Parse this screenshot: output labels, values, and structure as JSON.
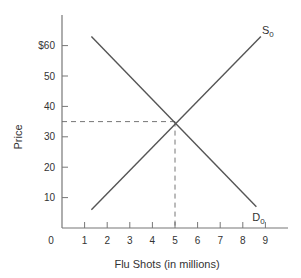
{
  "chart_data": {
    "type": "line",
    "title": "",
    "xlabel": "Flu Shots (in millions)",
    "ylabel": "Price",
    "xlim": [
      0,
      10
    ],
    "ylim": [
      0,
      70
    ],
    "x_ticks": [
      1,
      2,
      3,
      4,
      5,
      6,
      7,
      8,
      9
    ],
    "x_tick_labels": [
      "1",
      "2",
      "3",
      "4",
      "5",
      "6",
      "7",
      "8",
      "9"
    ],
    "y_ticks": [
      10,
      20,
      30,
      40,
      50,
      60
    ],
    "y_tick_labels": [
      "10",
      "20",
      "30",
      "40",
      "50",
      "$60"
    ],
    "origin_label": "0",
    "grid": false,
    "series": [
      {
        "name": "S0",
        "label_main": "S",
        "label_sub": "0",
        "points": [
          [
            1.3,
            6
          ],
          [
            8.8,
            63
          ]
        ]
      },
      {
        "name": "D0",
        "label_main": "D",
        "label_sub": "0",
        "points": [
          [
            1.3,
            63
          ],
          [
            8.6,
            7
          ]
        ]
      }
    ],
    "equilibrium": {
      "x": 5,
      "y": 35
    },
    "colors": {
      "line": "#555555",
      "axis": "#777777",
      "dashed": "#666666"
    }
  }
}
